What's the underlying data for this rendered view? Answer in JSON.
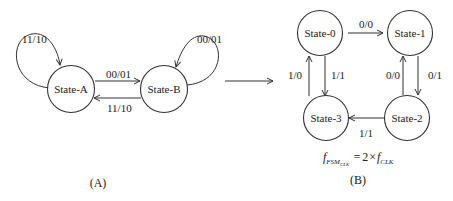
{
  "diagram_a": {
    "caption": "(A)",
    "states": [
      {
        "id": "A",
        "label": "State-A"
      },
      {
        "id": "B",
        "label": "State-B"
      }
    ],
    "transitions": [
      {
        "from": "A",
        "to": "A",
        "label": "11/10"
      },
      {
        "from": "B",
        "to": "B",
        "label": "00/01"
      },
      {
        "from": "A",
        "to": "B",
        "label": "00/01"
      },
      {
        "from": "B",
        "to": "A",
        "label": "11/10"
      }
    ]
  },
  "diagram_b": {
    "caption": "(B)",
    "states": [
      {
        "id": "0",
        "label": "State-0"
      },
      {
        "id": "1",
        "label": "State-1"
      },
      {
        "id": "2",
        "label": "State-2"
      },
      {
        "id": "3",
        "label": "State-3"
      }
    ],
    "transitions": [
      {
        "from": "0",
        "to": "1",
        "label": "0/0"
      },
      {
        "from": "1",
        "to": "2",
        "label": "0/1"
      },
      {
        "from": "2",
        "to": "1",
        "label": "0/0"
      },
      {
        "from": "2",
        "to": "3",
        "label": "1/1"
      },
      {
        "from": "3",
        "to": "0",
        "label": "1/0"
      },
      {
        "from": "0",
        "to": "3",
        "label": "1/1"
      }
    ],
    "formula": {
      "lhs_base": "f",
      "lhs_sub": "FSM",
      "lhs_subsub": "CLK",
      "equals": "=",
      "rhs_factor": "2",
      "times": "×",
      "rhs_base": "f",
      "rhs_sub": "CLK"
    }
  },
  "transform_arrow": {
    "meaning": "maps (A) to (B)"
  }
}
